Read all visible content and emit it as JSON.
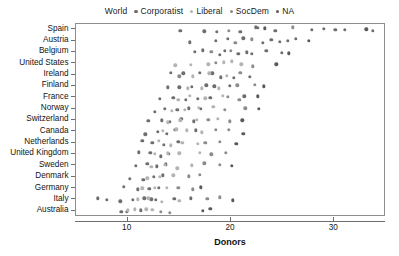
{
  "chart_data": {
    "type": "scatter",
    "title": "",
    "xlabel": "Donors",
    "ylabel": "",
    "xlim": [
      5,
      35
    ],
    "ylim_categories": true,
    "grid": false,
    "legend_position": "top-center",
    "legend_title": "World",
    "x_ticks": [
      10,
      20,
      30
    ],
    "x_tick_labels": [
      "10",
      "20",
      "30"
    ],
    "categories": [
      "Spain",
      "Austria",
      "Belgium",
      "United States",
      "Ireland",
      "Finland",
      "France",
      "Norway",
      "Switzerland",
      "Canada",
      "Netherlands",
      "United Kingdom",
      "Sweden",
      "Denmark",
      "Germany",
      "Italy",
      "Australia"
    ],
    "series": [
      {
        "name": "Corporatist",
        "color": "#6e6e6e",
        "points": [
          {
            "country": "Spain",
            "x": 15.1
          },
          {
            "country": "Spain",
            "x": 17.4
          },
          {
            "country": "Spain",
            "x": 18.6
          },
          {
            "country": "Spain",
            "x": 20.9
          },
          {
            "country": "Spain",
            "x": 22.4
          },
          {
            "country": "Spain",
            "x": 22.6
          },
          {
            "country": "Spain",
            "x": 24.3
          },
          {
            "country": "Spain",
            "x": 27.8
          },
          {
            "country": "Spain",
            "x": 29.0
          },
          {
            "country": "Spain",
            "x": 30.1
          },
          {
            "country": "Spain",
            "x": 31.0
          },
          {
            "country": "Spain",
            "x": 33.7
          },
          {
            "country": "Austria",
            "x": 16.0
          },
          {
            "country": "Austria",
            "x": 18.5
          },
          {
            "country": "Austria",
            "x": 19.7
          },
          {
            "country": "Austria",
            "x": 21.2
          },
          {
            "country": "Austria",
            "x": 23.1
          },
          {
            "country": "Austria",
            "x": 23.9
          },
          {
            "country": "Austria",
            "x": 24.7
          },
          {
            "country": "Austria",
            "x": 25.5
          },
          {
            "country": "Austria",
            "x": 26.3
          },
          {
            "country": "Belgium",
            "x": 16.5
          },
          {
            "country": "Belgium",
            "x": 17.3
          },
          {
            "country": "Belgium",
            "x": 18.9
          },
          {
            "country": "Belgium",
            "x": 19.4
          },
          {
            "country": "Belgium",
            "x": 20.7
          },
          {
            "country": "Belgium",
            "x": 21.5
          },
          {
            "country": "Belgium",
            "x": 22.0
          },
          {
            "country": "Belgium",
            "x": 23.4
          },
          {
            "country": "Belgium",
            "x": 24.9
          },
          {
            "country": "Ireland",
            "x": 14.2
          },
          {
            "country": "Ireland",
            "x": 15.4
          },
          {
            "country": "Ireland",
            "x": 17.0
          },
          {
            "country": "Ireland",
            "x": 18.2
          },
          {
            "country": "Ireland",
            "x": 19.0
          },
          {
            "country": "Ireland",
            "x": 20.3
          },
          {
            "country": "Ireland",
            "x": 21.8
          },
          {
            "country": "Finland",
            "x": 13.9
          },
          {
            "country": "Finland",
            "x": 15.0
          },
          {
            "country": "Finland",
            "x": 16.2
          },
          {
            "country": "Finland",
            "x": 17.6
          },
          {
            "country": "Finland",
            "x": 18.4
          },
          {
            "country": "Finland",
            "x": 19.9
          },
          {
            "country": "France",
            "x": 13.1
          },
          {
            "country": "France",
            "x": 14.4
          },
          {
            "country": "France",
            "x": 15.6
          },
          {
            "country": "France",
            "x": 16.8
          },
          {
            "country": "France",
            "x": 18.0
          },
          {
            "country": "France",
            "x": 21.3
          },
          {
            "country": "Norway",
            "x": 12.6
          },
          {
            "country": "Norway",
            "x": 13.6
          },
          {
            "country": "Norway",
            "x": 14.8
          },
          {
            "country": "Norway",
            "x": 15.9
          },
          {
            "country": "Norway",
            "x": 17.1
          },
          {
            "country": "Switzerland",
            "x": 12.0
          },
          {
            "country": "Switzerland",
            "x": 13.3
          },
          {
            "country": "Switzerland",
            "x": 14.1
          },
          {
            "country": "Switzerland",
            "x": 15.2
          },
          {
            "country": "Switzerland",
            "x": 16.4
          },
          {
            "country": "Canada",
            "x": 11.7
          },
          {
            "country": "Canada",
            "x": 12.9
          },
          {
            "country": "Canada",
            "x": 13.8
          },
          {
            "country": "Canada",
            "x": 14.6
          },
          {
            "country": "Canada",
            "x": 16.6
          },
          {
            "country": "Netherlands",
            "x": 11.4
          },
          {
            "country": "Netherlands",
            "x": 12.4
          },
          {
            "country": "Netherlands",
            "x": 13.5
          },
          {
            "country": "Netherlands",
            "x": 14.9
          },
          {
            "country": "United Kingdom",
            "x": 11.1
          },
          {
            "country": "United Kingdom",
            "x": 12.2
          },
          {
            "country": "United Kingdom",
            "x": 13.2
          },
          {
            "country": "United Kingdom",
            "x": 14.0
          },
          {
            "country": "Sweden",
            "x": 10.8
          },
          {
            "country": "Sweden",
            "x": 11.9
          },
          {
            "country": "Sweden",
            "x": 12.8
          },
          {
            "country": "Sweden",
            "x": 13.7
          },
          {
            "country": "Denmark",
            "x": 10.2
          },
          {
            "country": "Denmark",
            "x": 11.5
          },
          {
            "country": "Denmark",
            "x": 12.5
          },
          {
            "country": "Denmark",
            "x": 13.4
          },
          {
            "country": "Germany",
            "x": 9.6
          },
          {
            "country": "Germany",
            "x": 11.0
          },
          {
            "country": "Germany",
            "x": 12.1
          },
          {
            "country": "Germany",
            "x": 13.0
          },
          {
            "country": "Italy",
            "x": 7.1
          },
          {
            "country": "Italy",
            "x": 8.0
          },
          {
            "country": "Italy",
            "x": 9.3
          },
          {
            "country": "Italy",
            "x": 10.5
          },
          {
            "country": "Italy",
            "x": 11.6
          },
          {
            "country": "Italy",
            "x": 12.3
          },
          {
            "country": "Italy",
            "x": 12.7
          },
          {
            "country": "Italy",
            "x": 14.5
          },
          {
            "country": "Italy",
            "x": 16.1
          },
          {
            "country": "Australia",
            "x": 9.4
          },
          {
            "country": "Australia",
            "x": 9.9
          },
          {
            "country": "Australia",
            "x": 11.3
          }
        ]
      },
      {
        "name": "Liberal",
        "color": "#b4b4b4",
        "points": [
          {
            "country": "United States",
            "x": 14.6
          },
          {
            "country": "United States",
            "x": 16.1
          },
          {
            "country": "United States",
            "x": 17.8
          },
          {
            "country": "United States",
            "x": 19.3
          },
          {
            "country": "United States",
            "x": 20.1
          },
          {
            "country": "United States",
            "x": 21.0
          },
          {
            "country": "Ireland",
            "x": 16.3
          },
          {
            "country": "Ireland",
            "x": 17.9
          },
          {
            "country": "Ireland",
            "x": 19.6
          },
          {
            "country": "Finland",
            "x": 15.8
          },
          {
            "country": "Finland",
            "x": 17.2
          },
          {
            "country": "Finland",
            "x": 18.8
          },
          {
            "country": "France",
            "x": 14.9
          },
          {
            "country": "France",
            "x": 16.0
          },
          {
            "country": "France",
            "x": 17.5
          },
          {
            "country": "France",
            "x": 19.2
          },
          {
            "country": "Norway",
            "x": 14.3
          },
          {
            "country": "Norway",
            "x": 15.5
          },
          {
            "country": "Norway",
            "x": 16.9
          },
          {
            "country": "Norway",
            "x": 18.3
          },
          {
            "country": "Switzerland",
            "x": 13.9
          },
          {
            "country": "Switzerland",
            "x": 15.1
          },
          {
            "country": "Switzerland",
            "x": 16.7
          },
          {
            "country": "Switzerland",
            "x": 18.7
          },
          {
            "country": "Canada",
            "x": 13.4
          },
          {
            "country": "Canada",
            "x": 14.7
          },
          {
            "country": "Canada",
            "x": 15.7
          },
          {
            "country": "Canada",
            "x": 17.2
          },
          {
            "country": "Netherlands",
            "x": 13.0
          },
          {
            "country": "Netherlands",
            "x": 14.2
          },
          {
            "country": "Netherlands",
            "x": 15.3
          },
          {
            "country": "Netherlands",
            "x": 16.8
          },
          {
            "country": "United Kingdom",
            "x": 12.6
          },
          {
            "country": "United Kingdom",
            "x": 13.9
          },
          {
            "country": "United Kingdom",
            "x": 15.0
          },
          {
            "country": "United Kingdom",
            "x": 17.0
          },
          {
            "country": "Sweden",
            "x": 12.3
          },
          {
            "country": "Sweden",
            "x": 13.6
          },
          {
            "country": "Sweden",
            "x": 14.8
          },
          {
            "country": "Sweden",
            "x": 16.2
          },
          {
            "country": "Denmark",
            "x": 11.9
          },
          {
            "country": "Denmark",
            "x": 13.1
          },
          {
            "country": "Denmark",
            "x": 14.4
          },
          {
            "country": "Germany",
            "x": 11.4
          },
          {
            "country": "Germany",
            "x": 12.6
          },
          {
            "country": "Germany",
            "x": 13.8
          },
          {
            "country": "Italy",
            "x": 11.0
          },
          {
            "country": "Italy",
            "x": 12.0
          },
          {
            "country": "Italy",
            "x": 13.3
          },
          {
            "country": "Italy",
            "x": 15.0
          },
          {
            "country": "Australia",
            "x": 10.0
          },
          {
            "country": "Australia",
            "x": 10.7
          },
          {
            "country": "Australia",
            "x": 11.8
          },
          {
            "country": "Australia",
            "x": 12.4
          }
        ]
      },
      {
        "name": "SocDem",
        "color": "#8c8c8c",
        "points": [
          {
            "country": "Spain",
            "x": 19.8
          },
          {
            "country": "Spain",
            "x": 26.0
          },
          {
            "country": "Austria",
            "x": 20.4
          },
          {
            "country": "Austria",
            "x": 22.0
          },
          {
            "country": "Belgium",
            "x": 18.1
          },
          {
            "country": "Belgium",
            "x": 20.0
          },
          {
            "country": "United States",
            "x": 18.5
          },
          {
            "country": "United States",
            "x": 22.1
          },
          {
            "country": "Ireland",
            "x": 15.0
          },
          {
            "country": "Ireland",
            "x": 20.9
          },
          {
            "country": "Finland",
            "x": 20.6
          },
          {
            "country": "Finland",
            "x": 22.3
          },
          {
            "country": "France",
            "x": 19.7
          },
          {
            "country": "France",
            "x": 20.8
          },
          {
            "country": "Norway",
            "x": 19.4
          },
          {
            "country": "Norway",
            "x": 21.4
          },
          {
            "country": "Switzerland",
            "x": 17.8
          },
          {
            "country": "Switzerland",
            "x": 19.9
          },
          {
            "country": "Canada",
            "x": 18.5
          },
          {
            "country": "Canada",
            "x": 19.8
          },
          {
            "country": "Netherlands",
            "x": 17.5
          },
          {
            "country": "Netherlands",
            "x": 18.9
          },
          {
            "country": "United Kingdom",
            "x": 18.1
          },
          {
            "country": "United Kingdom",
            "x": 19.5
          },
          {
            "country": "Sweden",
            "x": 17.4
          },
          {
            "country": "Sweden",
            "x": 18.9
          },
          {
            "country": "Denmark",
            "x": 15.9
          },
          {
            "country": "Denmark",
            "x": 17.0
          },
          {
            "country": "Germany",
            "x": 14.9
          },
          {
            "country": "Germany",
            "x": 16.3
          },
          {
            "country": "Italy",
            "x": 17.7
          },
          {
            "country": "Italy",
            "x": 18.9
          },
          {
            "country": "Australia",
            "x": 13.2
          },
          {
            "country": "Australia",
            "x": 14.1
          }
        ]
      },
      {
        "name": "NA",
        "color": "#5a5a5a",
        "points": [
          {
            "country": "Spain",
            "x": 23.3
          },
          {
            "country": "Spain",
            "x": 33.1
          },
          {
            "country": "Austria",
            "x": 27.5
          },
          {
            "country": "Belgium",
            "x": 25.6
          },
          {
            "country": "United States",
            "x": 24.4
          },
          {
            "country": "Finland",
            "x": 23.2
          },
          {
            "country": "France",
            "x": 22.6
          },
          {
            "country": "Norway",
            "x": 22.7
          },
          {
            "country": "Switzerland",
            "x": 21.1
          },
          {
            "country": "Canada",
            "x": 21.2
          },
          {
            "country": "Netherlands",
            "x": 20.5
          },
          {
            "country": "Sweden",
            "x": 20.1
          },
          {
            "country": "Germany",
            "x": 17.1
          },
          {
            "country": "Italy",
            "x": 20.2
          },
          {
            "country": "Australia",
            "x": 17.3
          },
          {
            "country": "Australia",
            "x": 18.0
          }
        ]
      }
    ]
  },
  "legend": {
    "title": "World",
    "entries": [
      {
        "label": "Corporatist",
        "color": "#6e6e6e"
      },
      {
        "label": "Liberal",
        "color": "#b4b4b4"
      },
      {
        "label": "SocDem",
        "color": "#8c8c8c"
      },
      {
        "label": "NA",
        "color": "#5a5a5a"
      }
    ]
  },
  "axes": {
    "x_title": "Donors",
    "x_tick_labels": [
      "10",
      "20",
      "30"
    ],
    "y_tick_labels": [
      "Spain",
      "Austria",
      "Belgium",
      "United States",
      "Ireland",
      "Finland",
      "France",
      "Norway",
      "Switzerland",
      "Canada",
      "Netherlands",
      "United Kingdom",
      "Sweden",
      "Denmark",
      "Germany",
      "Italy",
      "Australia"
    ]
  },
  "colors": {
    "frame": "#8d8d8d",
    "text": "#141414",
    "background": "#ffffff"
  }
}
